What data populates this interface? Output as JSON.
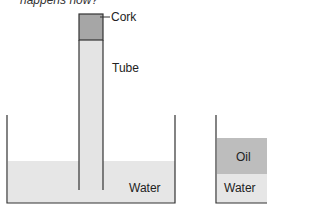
{
  "caption": "happens now?",
  "labels": {
    "cork": "Cork",
    "tube": "Tube",
    "water_left": "Water",
    "oil": "Oil",
    "water_right": "Water"
  },
  "colors": {
    "line": "#333333",
    "water": "#e6e6e6",
    "tube_fill": "#e4e4e4",
    "cork": "#a6a6a6",
    "oil": "#bdbdbd"
  }
}
